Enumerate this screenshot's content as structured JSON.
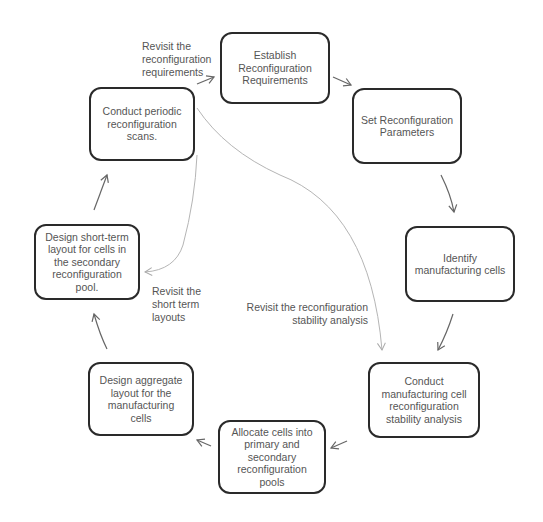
{
  "diagram": {
    "type": "cycle-flowchart",
    "nodes": [
      {
        "id": "n1",
        "label": "Establish Reconfiguration Requirements"
      },
      {
        "id": "n2",
        "label": "Set Reconfiguration Parameters"
      },
      {
        "id": "n3",
        "label": "Identify manufacturing cells"
      },
      {
        "id": "n4",
        "label": "Conduct manufacturing cell reconfiguration stability analysis"
      },
      {
        "id": "n5",
        "label": "Allocate cells into primary and secondary reconfiguration pools"
      },
      {
        "id": "n6",
        "label": "Design aggregate layout for the manufacturing cells"
      },
      {
        "id": "n7",
        "label": "Design short-term layout for cells in the secondary reconfiguration pool."
      },
      {
        "id": "n8",
        "label": "Conduct periodic reconfiguration scans."
      }
    ],
    "edges": [
      {
        "from": "n1",
        "to": "n2"
      },
      {
        "from": "n2",
        "to": "n3"
      },
      {
        "from": "n3",
        "to": "n4"
      },
      {
        "from": "n4",
        "to": "n5"
      },
      {
        "from": "n5",
        "to": "n6"
      },
      {
        "from": "n6",
        "to": "n7"
      },
      {
        "from": "n7",
        "to": "n8"
      },
      {
        "from": "n8",
        "to": "n1",
        "label": "Revisit the reconfiguration requirements"
      },
      {
        "from": "n8",
        "to": "n4",
        "label": "Revisit the reconfiguration stability analysis",
        "style": "light"
      },
      {
        "from": "n8",
        "to": "n7",
        "label": "Revisit the short term layouts",
        "style": "light"
      }
    ],
    "edge_labels": {
      "revisit_requirements": [
        "Revisit the",
        "reconfiguration",
        "requirements"
      ],
      "revisit_stability": [
        "Revisit the reconfiguration",
        "stability analysis"
      ],
      "revisit_short_term": [
        "Revisit the",
        "short term",
        "layouts"
      ]
    }
  },
  "colors": {
    "node_border": "#2a2a2a",
    "text": "#555555",
    "arrow": "#666666",
    "light_arrow": "#b0b0b0"
  }
}
